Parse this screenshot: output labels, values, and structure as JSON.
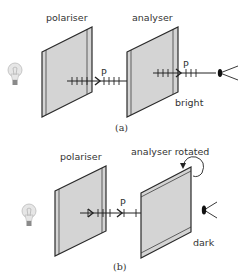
{
  "diagram_a": {
    "caption": "(a)",
    "polariser_label": "polariser",
    "analyser_label": "analyser",
    "ray_label_1": "P",
    "ray_label_2": "P",
    "result_label": "bright"
  },
  "diagram_b": {
    "caption": "(b)",
    "polariser_label": "polariser",
    "analyser_label": "analyser rotated",
    "ray_label": "P",
    "result_label": "dark"
  },
  "colors": {
    "filter_fill": "#d4d4d4",
    "filter_stroke": "#2a2a2a",
    "line": "#222222",
    "bulb": "#c8c8c8"
  }
}
